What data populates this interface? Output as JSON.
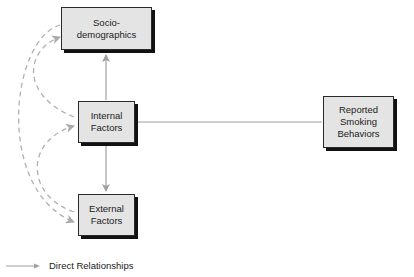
{
  "diagram": {
    "nodes": [
      {
        "id": "socio",
        "label": "Socio-\ndemographics"
      },
      {
        "id": "internal",
        "label": "Internal\nFactors"
      },
      {
        "id": "external",
        "label": "External\nFactors"
      },
      {
        "id": "reported",
        "label": "Reported\nSmoking\nBehaviors"
      }
    ],
    "edges": [
      {
        "from": "internal",
        "to": "socio",
        "type": "direct"
      },
      {
        "from": "internal",
        "to": "external",
        "type": "direct"
      },
      {
        "from": "internal",
        "to": "reported",
        "type": "direct-line"
      },
      {
        "from": "socio",
        "to": "internal",
        "type": "dashed"
      },
      {
        "from": "internal",
        "to": "socio",
        "type": "dashed"
      },
      {
        "from": "external",
        "to": "internal",
        "type": "dashed"
      },
      {
        "from": "socio",
        "to": "external",
        "type": "dashed"
      }
    ],
    "legend": {
      "direct_label": "Direct Relationships"
    },
    "colors": {
      "box_fill": "#e4e4e4",
      "arrow": "#a0a0a0",
      "dashed": "#b0b0b0"
    }
  }
}
